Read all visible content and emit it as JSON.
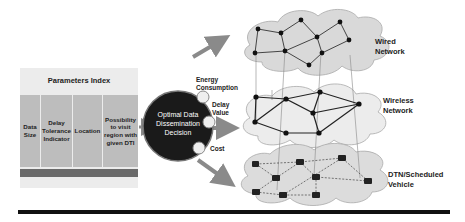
{
  "parameters_index": {
    "title": "Parameters Index",
    "columns": [
      "Data Size",
      "Delay Tolerance Indicator",
      "Location",
      "Possibility to visit region with given DTI"
    ]
  },
  "decision": {
    "label": "Optimal Data Dissemination Decision",
    "outputs": [
      "Energy Consumption",
      "Delay Value",
      "Cost"
    ]
  },
  "networks": [
    {
      "label": "Wired Network"
    },
    {
      "label": "Wireless Network"
    },
    {
      "label": "DTN/Scheduled Vehicle"
    }
  ]
}
